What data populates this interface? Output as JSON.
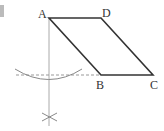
{
  "figure": {
    "type": "parallelogram-construction",
    "labels": {
      "A": "A",
      "B": "B",
      "C": "C",
      "D": "D"
    },
    "points": {
      "A": [
        49,
        18
      ],
      "D": [
        101,
        18
      ],
      "B": [
        101,
        75
      ],
      "C": [
        153,
        75
      ]
    },
    "colors": {
      "edge": "#333333",
      "construction": "#999999",
      "marker": "#bbbbbb"
    }
  }
}
